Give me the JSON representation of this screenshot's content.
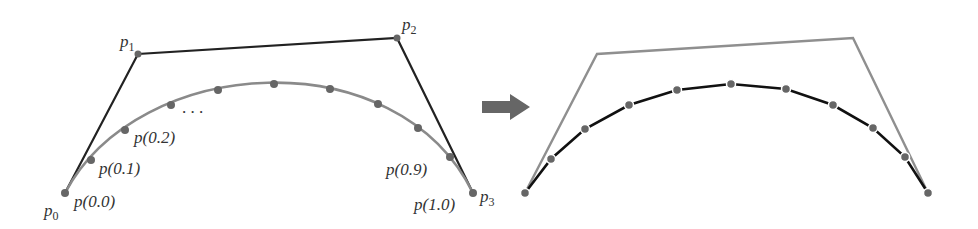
{
  "colors": {
    "control_polygon_left": "#222222",
    "curve_left": "#8a8a8a",
    "point": "#666666",
    "arrow": "#666666",
    "control_polygon_right": "#8f8f8f",
    "segments_right": "#111111"
  },
  "left": {
    "control_points": [
      {
        "name": "p",
        "sub": "0",
        "x": 65,
        "y": 193
      },
      {
        "name": "p",
        "sub": "1",
        "x": 138,
        "y": 54
      },
      {
        "name": "p",
        "sub": "2",
        "x": 397,
        "y": 38
      },
      {
        "name": "p",
        "sub": "3",
        "x": 473,
        "y": 193
      }
    ],
    "labels": {
      "p00": "p(0.0)",
      "p01": "p(0.1)",
      "p02": "p(0.2)",
      "p09": "p(0.9)",
      "p10": "p(1.0)",
      "ellipsis": ". . ."
    }
  },
  "arrow": {
    "direction": "right"
  },
  "right": {
    "description": "Curve approximated by line segments between sampled points"
  }
}
